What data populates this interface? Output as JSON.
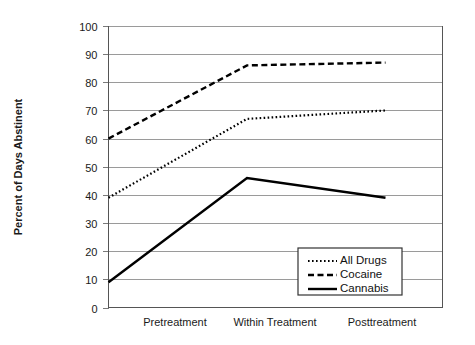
{
  "chart_data": {
    "type": "line",
    "title": "",
    "xlabel": "",
    "ylabel": "Percent of Days Abstinent",
    "categories": [
      "Pretreatment",
      "Within Treatment",
      "Posttreatment"
    ],
    "ylim": [
      0,
      100
    ],
    "ytick_step": 10,
    "yticks": [
      "100",
      "90",
      "80",
      "70",
      "60",
      "50",
      "40",
      "30",
      "20",
      "10",
      "0"
    ],
    "grid": true,
    "legend_position": "bottom-right",
    "series": [
      {
        "name": "All Drugs",
        "style": "dotted",
        "color": "#000000",
        "values": [
          39,
          67,
          70
        ]
      },
      {
        "name": "Cocaine",
        "style": "dashed",
        "color": "#000000",
        "values": [
          60,
          86,
          87
        ]
      },
      {
        "name": "Cannabis",
        "style": "solid",
        "color": "#000000",
        "values": [
          9,
          46,
          39
        ]
      }
    ]
  },
  "legend": {
    "items": [
      {
        "label": "All Drugs"
      },
      {
        "label": "Cocaine"
      },
      {
        "label": "Cannabis"
      }
    ]
  },
  "axes": {
    "y_title": "Percent of Days Abstinent"
  }
}
